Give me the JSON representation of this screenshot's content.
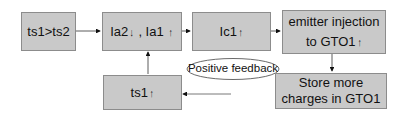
{
  "diagram": {
    "nodes": [
      {
        "id": "n1",
        "label": "ts1>ts2"
      },
      {
        "id": "n2",
        "label_a": "Ia2",
        "arrow_a": "↓",
        "sep": " , ",
        "label_b": "Ia1",
        "arrow_b": "↑"
      },
      {
        "id": "n3",
        "label": "Ic1",
        "arrow": "↑"
      },
      {
        "id": "n4",
        "line1": "emitter injection",
        "line2": "to GTO1",
        "arrow": "↑"
      },
      {
        "id": "n5",
        "line1": "Store more",
        "line2": "charges in GTO1"
      },
      {
        "id": "n6",
        "label": "ts1",
        "arrow": "↑"
      }
    ],
    "feedback_label": "Positive feedback",
    "edges": [
      {
        "from": "n1",
        "to": "n2"
      },
      {
        "from": "n2",
        "to": "n3"
      },
      {
        "from": "n3",
        "to": "n4"
      },
      {
        "from": "n4",
        "to": "n5"
      },
      {
        "from": "n5",
        "to": "n6"
      },
      {
        "from": "n6",
        "to": "n2"
      }
    ],
    "colors": {
      "box_fill": "#c9c9c9",
      "box_border": "#8c8c8c",
      "line": "#333333"
    }
  }
}
